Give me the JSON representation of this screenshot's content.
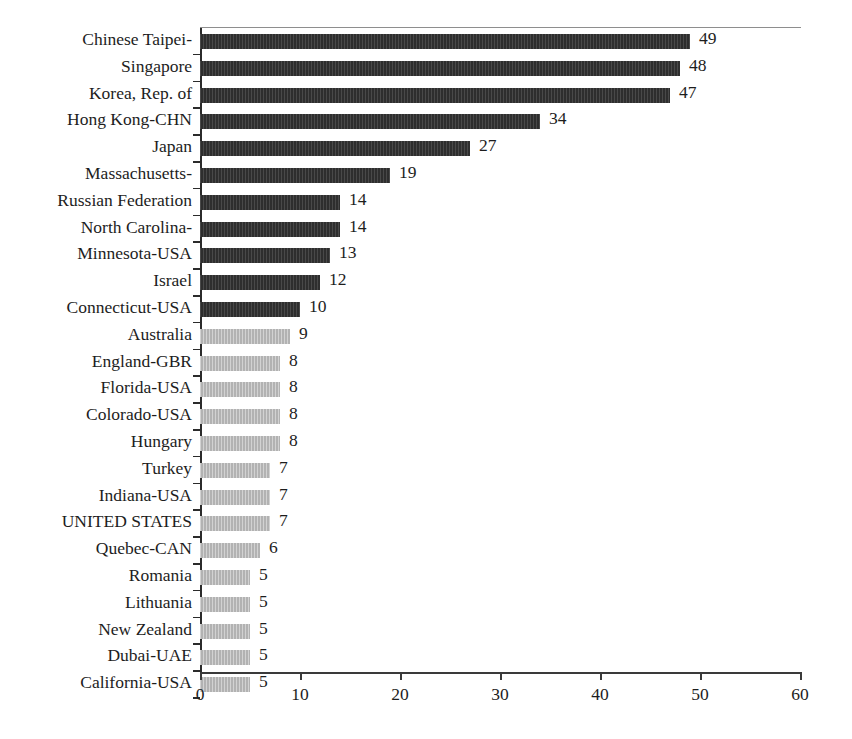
{
  "chart_data": {
    "type": "bar",
    "orientation": "horizontal",
    "title": "",
    "subtitle": "",
    "xlabel": "",
    "ylabel": "",
    "xlim": [
      0,
      60
    ],
    "xticks": [
      "0",
      "10",
      "20",
      "30",
      "40",
      "50",
      "60"
    ],
    "xtick_values": [
      0,
      10,
      20,
      30,
      40,
      50,
      60
    ],
    "grid": false,
    "legend": "none",
    "series_colors": {
      "high": "#2e2e2e",
      "low": "#b2b2b2"
    },
    "categories": [
      "Chinese Taipei-",
      "Singapore",
      "Korea, Rep. of",
      "Hong Kong-CHN",
      "Japan",
      "Massachusetts-",
      "Russian Federation",
      "North Carolina-",
      "Minnesota-USA",
      "Israel",
      "Connecticut-USA",
      "Australia",
      "England-GBR",
      "Florida-USA",
      "Colorado-USA",
      "Hungary",
      "Turkey",
      "Indiana-USA",
      "UNITED STATES",
      "Quebec-CAN",
      "Romania",
      "Lithuania",
      "New Zealand",
      "Dubai-UAE",
      "California-USA"
    ],
    "values": [
      49,
      48,
      47,
      34,
      27,
      19,
      14,
      14,
      13,
      12,
      10,
      9,
      8,
      8,
      8,
      8,
      7,
      7,
      7,
      6,
      5,
      5,
      5,
      5,
      5
    ],
    "value_labels": [
      "49",
      "48",
      "47",
      "34",
      "27",
      "19",
      "14",
      "14",
      "13",
      "12",
      "10",
      "9",
      "8",
      "8",
      "8",
      "8",
      "7",
      "7",
      "7",
      "6",
      "5",
      "5",
      "5",
      "5",
      "5"
    ],
    "bar_styles": [
      "dark",
      "dark",
      "dark",
      "dark",
      "dark",
      "dark",
      "dark",
      "dark",
      "dark",
      "dark",
      "dark",
      "light",
      "light",
      "light",
      "light",
      "light",
      "light",
      "light",
      "light",
      "light",
      "light",
      "light",
      "light",
      "light",
      "light"
    ]
  }
}
